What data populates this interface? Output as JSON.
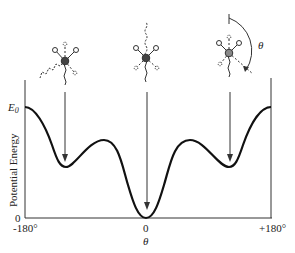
{
  "diagram": {
    "type": "potential-energy-vs-rotation-angle",
    "y_axis": {
      "label": "Potential Energy",
      "ticks": [
        {
          "label": "E",
          "subscript": "0",
          "role": "barrier-level"
        },
        {
          "label": "0",
          "role": "zero"
        }
      ]
    },
    "x_axis": {
      "label": "θ",
      "ticks": [
        "-180°",
        "0",
        "+180°"
      ]
    },
    "angle_symbol": "θ",
    "conformers": [
      {
        "name": "gauche-left",
        "position": "-120°",
        "description": "staggered, gauche (minimum)"
      },
      {
        "name": "anti",
        "position": "0",
        "description": "staggered, anti (global minimum)"
      },
      {
        "name": "gauche-right",
        "position": "+120°",
        "description": "staggered, gauche (minimum)"
      }
    ],
    "curve_features": [
      {
        "x": "-180°",
        "level": "E0"
      },
      {
        "x": "-120°",
        "level": "local minimum"
      },
      {
        "x": "-60°",
        "level": "local maximum"
      },
      {
        "x": "0",
        "level": "0 (global minimum)"
      },
      {
        "x": "+60°",
        "level": "local maximum"
      },
      {
        "x": "+120°",
        "level": "local minimum"
      },
      {
        "x": "+180°",
        "level": "E0"
      }
    ],
    "colors": {
      "line": "#111111",
      "text": "#222222",
      "background": "#ffffff"
    }
  }
}
